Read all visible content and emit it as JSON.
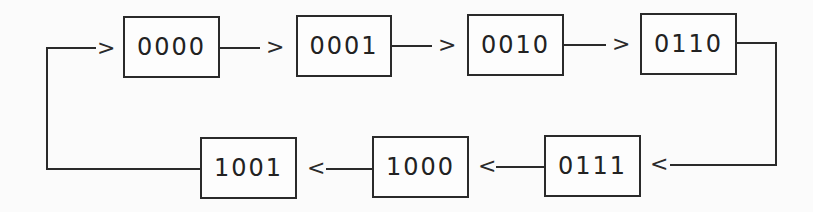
{
  "diagram": {
    "type": "state-sequence",
    "direction": "clockwise-loop",
    "states": [
      {
        "id": "s0",
        "label": "0000"
      },
      {
        "id": "s1",
        "label": "0001"
      },
      {
        "id": "s2",
        "label": "0010"
      },
      {
        "id": "s3",
        "label": "0110"
      },
      {
        "id": "s4",
        "label": "0111"
      },
      {
        "id": "s5",
        "label": "1000"
      },
      {
        "id": "s6",
        "label": "1001"
      }
    ],
    "transitions": [
      {
        "from": "0000",
        "to": "0001"
      },
      {
        "from": "0001",
        "to": "0010"
      },
      {
        "from": "0010",
        "to": "0110"
      },
      {
        "from": "0110",
        "to": "0111"
      },
      {
        "from": "0111",
        "to": "1000"
      },
      {
        "from": "1000",
        "to": "1001"
      },
      {
        "from": "1001",
        "to": "0000"
      }
    ],
    "arrow_glyphs": {
      "right": ">",
      "left": "<"
    },
    "colors": {
      "stroke": "#2a2a2a",
      "background": "#fbfbfb",
      "text": "#222222"
    }
  }
}
